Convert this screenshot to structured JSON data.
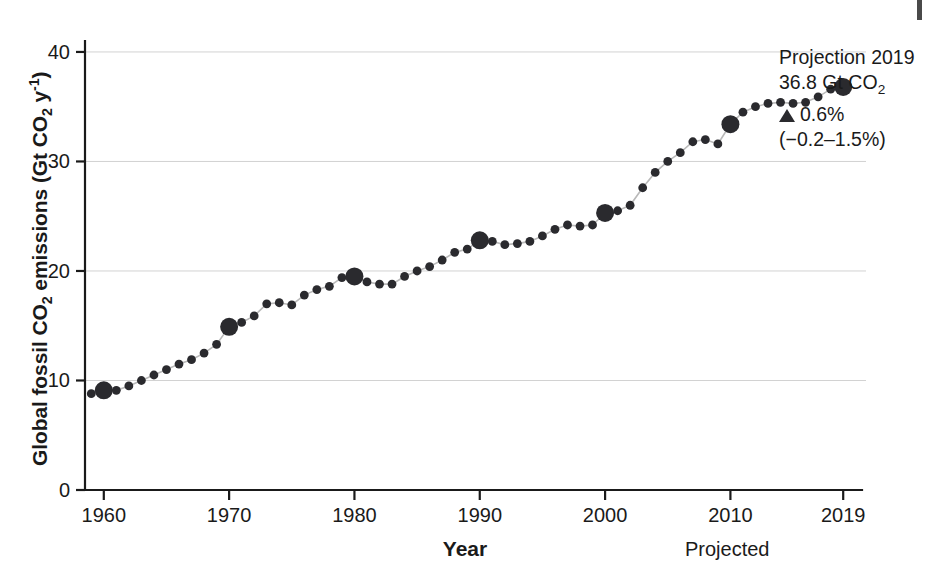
{
  "figure": {
    "background_color": "#ffffff",
    "ink_color": "#2a2a2e",
    "grid_color": "#d2d2d2",
    "line_color": "#b9b9b9"
  },
  "axes": {
    "ylabel_html": "Global fossil CO<sub>2</sub> emissions (Gt CO<sub>2</sub> y<sup>-1</sup>)",
    "ylabel_text": "Global fossil CO2 emissions (Gt CO2 y-1)",
    "xlabel": "Year",
    "projected_note": "Projected",
    "yticks": [
      "0",
      "10",
      "20",
      "30",
      "40"
    ],
    "xticks": [
      "1960",
      "1970",
      "1980",
      "1990",
      "2000",
      "2010",
      "2019"
    ]
  },
  "annotation": {
    "line1": "Projection 2019",
    "line2_value": "36.8 Gt CO",
    "line2_sub": "2",
    "line3_marker": "triangle-up",
    "line3": "0.6%",
    "line4": "(−0.2–1.5%)"
  },
  "chart_data": {
    "type": "line",
    "title": "",
    "xlabel": "Year",
    "ylabel": "Global fossil CO2 emissions (Gt CO2 y-1)",
    "xlim": [
      1958.5,
      2020.5
    ],
    "ylim": [
      0,
      41
    ],
    "xticks": [
      1960,
      1970,
      1980,
      1990,
      2000,
      2010,
      2019
    ],
    "yticks": [
      0,
      10,
      20,
      30,
      40
    ],
    "grid": "horizontal",
    "legend": "none",
    "marker_style": "filled-circle",
    "highlighted_years": [
      1960,
      1970,
      1980,
      1990,
      2000,
      2010,
      2019
    ],
    "annotations": [
      {
        "text": "Projection 2019: 36.8 Gt CO2, up 0.6% (-0.2-1.5%)",
        "x": 2019,
        "y": 36.8,
        "position": "right"
      },
      {
        "text": "Projected",
        "x": 2019,
        "y": 0,
        "position": "below-axis"
      }
    ],
    "x": [
      1959,
      1960,
      1961,
      1962,
      1963,
      1964,
      1965,
      1966,
      1967,
      1968,
      1969,
      1970,
      1971,
      1972,
      1973,
      1974,
      1975,
      1976,
      1977,
      1978,
      1979,
      1980,
      1981,
      1982,
      1983,
      1984,
      1985,
      1986,
      1987,
      1988,
      1989,
      1990,
      1991,
      1992,
      1993,
      1994,
      1995,
      1996,
      1997,
      1998,
      1999,
      2000,
      2001,
      2002,
      2003,
      2004,
      2005,
      2006,
      2007,
      2008,
      2009,
      2010,
      2011,
      2012,
      2013,
      2014,
      2015,
      2016,
      2017,
      2018,
      2019
    ],
    "values": [
      8.8,
      9.1,
      9.1,
      9.5,
      10.0,
      10.5,
      11.0,
      11.5,
      11.9,
      12.5,
      13.3,
      14.9,
      15.3,
      15.9,
      17.0,
      17.1,
      16.9,
      17.8,
      18.3,
      18.6,
      19.4,
      19.5,
      19.0,
      18.8,
      18.8,
      19.5,
      20.0,
      20.4,
      21.0,
      21.7,
      22.0,
      22.8,
      22.7,
      22.4,
      22.5,
      22.7,
      23.2,
      23.8,
      24.2,
      24.1,
      24.2,
      25.3,
      25.5,
      26.0,
      27.6,
      29.0,
      30.0,
      30.8,
      31.8,
      32.0,
      31.6,
      33.4,
      34.5,
      35.0,
      35.3,
      35.4,
      35.3,
      35.4,
      35.9,
      36.6,
      36.8
    ]
  }
}
